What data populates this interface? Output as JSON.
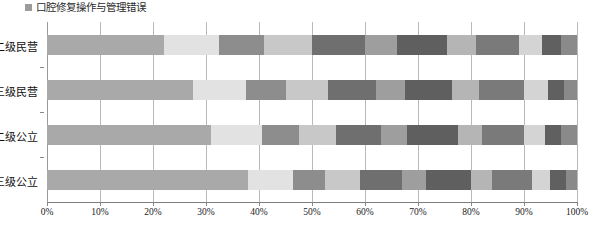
{
  "legend": {
    "marker": "legend-swatch",
    "label": "口腔修复操作与管理错误"
  },
  "axis": {
    "x_ticks": [
      "0%",
      "10%",
      "20%",
      "30%",
      "40%",
      "50%",
      "60%",
      "70%",
      "80%",
      "90%",
      "100%"
    ],
    "categories": [
      "二级民营",
      "三级民营",
      "二级公立",
      "三级公立"
    ]
  },
  "colors": {
    "c1": "#a9a9a9",
    "c2": "#e2e2e2",
    "c3": "#8d8d8d",
    "c4": "#c8c8c8",
    "c5": "#6f6f6f",
    "c6": "#9e9e9e",
    "c7": "#5f5f5f",
    "c8": "#b5b5b5",
    "c9": "#7a7a7a",
    "c10": "#d4d4d4",
    "c11": "#606060",
    "c12": "#8a8a8a",
    "axis": "#7d7d7d",
    "grid": "#b9b9b9"
  },
  "chart_data": {
    "type": "bar",
    "orientation": "horizontal",
    "stacked": true,
    "normalized": true,
    "title": "",
    "xlabel": "",
    "ylabel": "",
    "xlim": [
      0,
      100
    ],
    "grid": true,
    "legend_position": "top-left",
    "categories": [
      "二级民营",
      "三级民营",
      "二级公立",
      "三级公立"
    ],
    "series": [
      {
        "name": "口腔修复操作与管理错误",
        "color": "#a9a9a9",
        "values": [
          22.0,
          27.5,
          31.0,
          38.0
        ]
      },
      {
        "name": "seg-2",
        "color": "#e2e2e2",
        "values": [
          10.5,
          10.0,
          9.5,
          8.5
        ]
      },
      {
        "name": "seg-3",
        "color": "#8d8d8d",
        "values": [
          8.5,
          7.5,
          7.0,
          6.0
        ]
      },
      {
        "name": "seg-4",
        "color": "#c8c8c8",
        "values": [
          9.0,
          8.0,
          7.0,
          6.5
        ]
      },
      {
        "name": "seg-5",
        "color": "#6f6f6f",
        "values": [
          10.0,
          9.0,
          8.5,
          8.0
        ]
      },
      {
        "name": "seg-6",
        "color": "#9e9e9e",
        "values": [
          6.0,
          5.5,
          5.0,
          4.5
        ]
      },
      {
        "name": "seg-7",
        "color": "#5f5f5f",
        "values": [
          9.5,
          9.0,
          9.5,
          8.5
        ]
      },
      {
        "name": "seg-8",
        "color": "#b5b5b5",
        "values": [
          5.5,
          5.0,
          4.5,
          4.0
        ]
      },
      {
        "name": "seg-9",
        "color": "#7a7a7a",
        "values": [
          8.0,
          8.5,
          8.0,
          7.5
        ]
      },
      {
        "name": "seg-10",
        "color": "#d4d4d4",
        "values": [
          4.5,
          4.5,
          4.0,
          3.5
        ]
      },
      {
        "name": "seg-11",
        "color": "#606060",
        "values": [
          3.5,
          3.0,
          3.0,
          3.0
        ]
      },
      {
        "name": "seg-12",
        "color": "#8a8a8a",
        "values": [
          3.0,
          2.5,
          3.0,
          2.0
        ]
      }
    ]
  }
}
